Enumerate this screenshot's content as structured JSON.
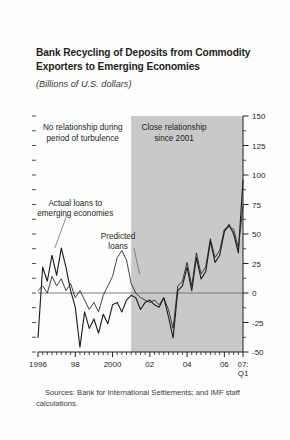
{
  "figure": {
    "title": "Bank Recycling of Deposits from Commodity Exporters to Emerging Economies",
    "subtitle": "(Billions of U.S. dollars)",
    "source": "Sources: Bank for International Settlements; and IMF staff calculations.",
    "background_color": "#fdfdfd",
    "shade_color": "#c9c9c9",
    "line_color": "#231f20"
  },
  "chart_data": {
    "type": "line",
    "title": "Bank Recycling of Deposits from Commodity Exporters to Emerging Economies",
    "subtitle": "(Billions of U.S. dollars)",
    "xlabel": "",
    "ylabel": "Billions of U.S. dollars",
    "ylim": [
      -50,
      150
    ],
    "yticks": [
      -50,
      -25,
      0,
      25,
      50,
      75,
      100,
      125,
      150
    ],
    "ytick_labels": [
      "-50",
      "-25",
      "0",
      "25",
      "50",
      "75",
      "100",
      "125",
      "150"
    ],
    "minor_ytick_step": 12.5,
    "y_axis_position": "right",
    "grid": false,
    "zero_line": true,
    "xlim": [
      1996.0,
      2007.0
    ],
    "xticks": [
      1996,
      1998,
      2000,
      2002,
      2004,
      2006,
      2007
    ],
    "xtick_labels": [
      "1996",
      "98",
      "2000",
      "02",
      "04",
      "06",
      "07:\nQ1"
    ],
    "x_minor_tick_step": 0.25,
    "x_frequency": "quarterly",
    "shaded_region": {
      "label": "Close relationship since 2001",
      "x_start": 2001.0,
      "x_end": 2007.0,
      "color": "#c9c9c9"
    },
    "annotations": [
      {
        "name": "left-annotation",
        "text": "No relationship during period of turbulence",
        "x": 1998.4,
        "y": 138
      },
      {
        "name": "right-annotation",
        "text": "Close relationship since 2001",
        "x": 2003.3,
        "y": 138
      },
      {
        "name": "actual-label",
        "text": "Actual loans to emerging economies",
        "x": 1998.0,
        "y": 74
      },
      {
        "name": "predicted-label",
        "text": "Predicted loans",
        "x": 2000.3,
        "y": 46
      }
    ],
    "legend_position": "inline-annotations",
    "series": [
      {
        "name": "Actual loans to emerging economies",
        "x": [
          1996.0,
          1996.25,
          1996.5,
          1996.75,
          1997.0,
          1997.25,
          1997.5,
          1997.75,
          1998.0,
          1998.25,
          1998.5,
          1998.75,
          1999.0,
          1999.25,
          1999.5,
          1999.75,
          2000.0,
          2000.25,
          2000.5,
          2000.75,
          2001.0,
          2001.25,
          2001.5,
          2001.75,
          2002.0,
          2002.25,
          2002.5,
          2002.75,
          2003.0,
          2003.25,
          2003.5,
          2003.75,
          2004.0,
          2004.25,
          2004.5,
          2004.75,
          2005.0,
          2005.25,
          2005.5,
          2005.75,
          2006.0,
          2006.25,
          2006.5,
          2006.75,
          2007.0
        ],
        "values": [
          -38,
          22,
          10,
          32,
          15,
          38,
          22,
          2,
          -12,
          -46,
          -16,
          -30,
          -22,
          -34,
          -18,
          -26,
          -10,
          -8,
          -16,
          -6,
          -2,
          -4,
          -14,
          -8,
          -6,
          -10,
          -12,
          -4,
          -20,
          -38,
          2,
          6,
          22,
          2,
          30,
          12,
          18,
          44,
          26,
          32,
          52,
          58,
          50,
          34,
          96
        ]
      },
      {
        "name": "Predicted loans",
        "x": [
          1996.0,
          1996.25,
          1996.5,
          1996.75,
          1997.0,
          1997.25,
          1997.5,
          1997.75,
          1998.0,
          1998.25,
          1998.5,
          1998.75,
          1999.0,
          1999.25,
          1999.5,
          1999.75,
          2000.0,
          2000.25,
          2000.5,
          2000.75,
          2001.0,
          2001.25,
          2001.5,
          2001.75,
          2002.0,
          2002.25,
          2002.5,
          2002.75,
          2003.0,
          2003.25,
          2003.5,
          2003.75,
          2004.0,
          2004.25,
          2004.5,
          2004.75,
          2005.0,
          2005.25,
          2005.5,
          2005.75,
          2006.0,
          2006.25,
          2006.5,
          2006.75,
          2007.0
        ],
        "values": [
          2,
          6,
          0,
          14,
          6,
          12,
          2,
          8,
          -4,
          2,
          -6,
          -14,
          -8,
          -16,
          -2,
          6,
          14,
          30,
          36,
          28,
          8,
          0,
          -4,
          -6,
          -8,
          -6,
          -10,
          -4,
          -14,
          -30,
          6,
          10,
          26,
          6,
          34,
          16,
          22,
          46,
          30,
          36,
          54,
          56,
          54,
          38,
          74
        ]
      }
    ],
    "leader_lines": [
      {
        "name": "actual-leader",
        "from_x": 1997.55,
        "from_y": 66,
        "to_x": 1996.9,
        "to_y": 38
      },
      {
        "name": "predicted-leader",
        "from_x": 2001.15,
        "from_y": 38,
        "to_x": 2001.45,
        "to_y": 16
      }
    ]
  }
}
